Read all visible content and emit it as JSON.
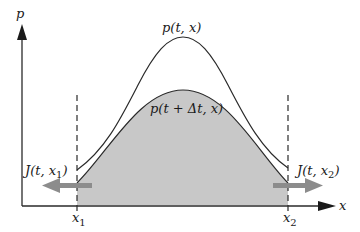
{
  "diagram": {
    "title": "",
    "axes": {
      "y_label": "p",
      "x_label": "x"
    },
    "boundaries": [
      {
        "label": "x",
        "subscript": "1"
      },
      {
        "label": "x",
        "subscript": "2"
      }
    ],
    "curves": [
      {
        "name": "p(t, x)",
        "label": "p(t, x)",
        "style": "tall narrow peak, unshaded"
      },
      {
        "name": "p(t + Δt, x)",
        "label": "p(t + Δt, x)",
        "style": "lower wider hump, shaded gray"
      }
    ],
    "fluxes": [
      {
        "label_main": "J(t, x",
        "subscript": "1",
        "label_close": ")",
        "direction": "left"
      },
      {
        "label_main": "J(t, x",
        "subscript": "2",
        "label_close": ")",
        "direction": "right"
      }
    ],
    "colors": {
      "shade": "#c8c8c8",
      "curve": "#2a2a2a",
      "arrow": "#8c8c8c",
      "axis": "#2a2a2a"
    }
  }
}
